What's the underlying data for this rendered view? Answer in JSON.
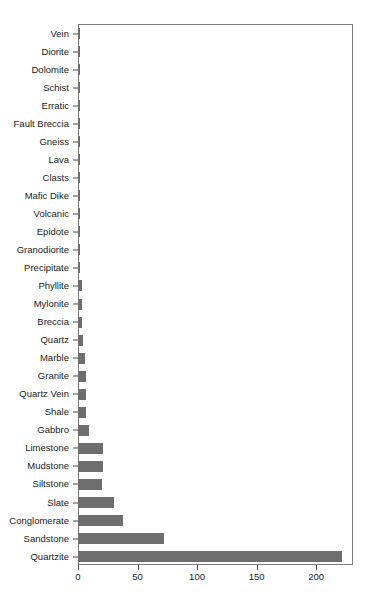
{
  "chart_data": {
    "type": "bar",
    "orientation": "horizontal",
    "title": "",
    "xlabel": "",
    "ylabel": "",
    "xlim": [
      0,
      231
    ],
    "xticks": [
      0,
      50,
      100,
      150,
      200
    ],
    "xticklabels": [
      "0",
      "50",
      "100",
      "150",
      "200"
    ],
    "grid": false,
    "legend": null,
    "bar_color": "#6e6e6e",
    "axis_color": "#7a7a7a",
    "text_color": "#1a1a1a",
    "categories": [
      "Vein",
      "Diorite",
      "Dolomite",
      "Schist",
      "Erratic",
      "Fault Breccia",
      "Gneiss",
      "Lava",
      "Clasts",
      "Mafic Dike",
      "Volcanic",
      "Epidote",
      "Granodiorite",
      "Precipitate",
      "Phyllite",
      "Mylonite",
      "Breccia",
      "Quartz",
      "Marble",
      "Granite",
      "Quartz Vein",
      "Shale",
      "Gabbro",
      "Limestone",
      "Mudstone",
      "Siltstone",
      "Slate",
      "Conglomerate",
      "Sandstone",
      "Quartzite"
    ],
    "values": [
      1,
      1,
      1,
      1,
      1,
      1,
      1,
      1,
      1,
      1,
      2,
      2,
      2,
      2,
      3,
      3,
      3,
      4,
      6,
      7,
      7,
      7,
      9,
      21,
      21,
      20,
      30,
      38,
      72,
      222
    ]
  }
}
